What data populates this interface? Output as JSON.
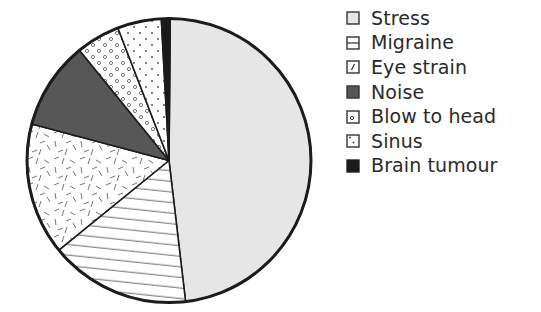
{
  "chart_data": {
    "type": "pie",
    "title": "",
    "start_angle_deg": 0,
    "direction": "clockwise",
    "categories": [
      "Stress",
      "Migraine",
      "Eye strain",
      "Noise",
      "Blow to head",
      "Sinus",
      "Brain tumour"
    ],
    "values": [
      48,
      16,
      15,
      10,
      5,
      5,
      1
    ],
    "unit": "percent (estimated)",
    "fills": [
      {
        "pattern": "light-gray-solid",
        "color": "#e6e6e6"
      },
      {
        "pattern": "horizontal-lines",
        "color": "#ffffff"
      },
      {
        "pattern": "random-dashes",
        "color": "#ffffff"
      },
      {
        "pattern": "dark-gray-solid",
        "color": "#575757"
      },
      {
        "pattern": "small-circles",
        "color": "#ffffff"
      },
      {
        "pattern": "dots",
        "color": "#ffffff"
      },
      {
        "pattern": "black-solid",
        "color": "#1a1a1a"
      }
    ],
    "legend_position": "right",
    "legend": [
      "Stress",
      "Migraine",
      "Eye strain",
      "Noise",
      "Blow to head",
      "Sinus",
      "Brain tumour"
    ]
  },
  "legend": {
    "items": [
      {
        "label": "Stress",
        "swatch": "stress"
      },
      {
        "label": "Migraine",
        "swatch": "migraine"
      },
      {
        "label": "Eye strain",
        "swatch": "eye"
      },
      {
        "label": "Noise",
        "swatch": "noise"
      },
      {
        "label": "Blow to head",
        "swatch": "blow"
      },
      {
        "label": "Sinus",
        "swatch": "sinus"
      },
      {
        "label": "Brain tumour",
        "swatch": "tumour"
      }
    ]
  }
}
